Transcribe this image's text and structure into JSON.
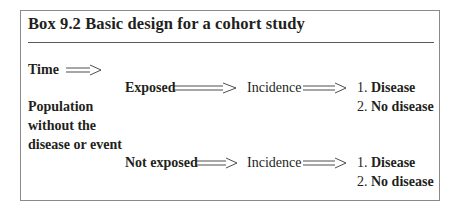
{
  "box": {
    "title": "Box 9.2  Basic design for a cohort study"
  },
  "time_label": "Time",
  "population_label": [
    "Population",
    "without the",
    "disease or event"
  ],
  "branches": [
    {
      "group": "Exposed",
      "measure": "Incidence",
      "outcomes": [
        "Disease",
        "No disease"
      ],
      "outcome_numbers": [
        "1.",
        "2."
      ]
    },
    {
      "group": "Not exposed",
      "measure": "Incidence",
      "outcomes": [
        "Disease",
        "No disease"
      ],
      "outcome_numbers": [
        "1.",
        "2."
      ]
    }
  ],
  "outcome_lines": {
    "b0_o0": "1. Disease",
    "b0_o1": "2. No disease",
    "b1_o0": "1. Disease",
    "b1_o1": "2. No disease"
  },
  "colors": {
    "text": "#231f20",
    "border": "#8a8a8a",
    "rule": "#5a5a5a"
  }
}
